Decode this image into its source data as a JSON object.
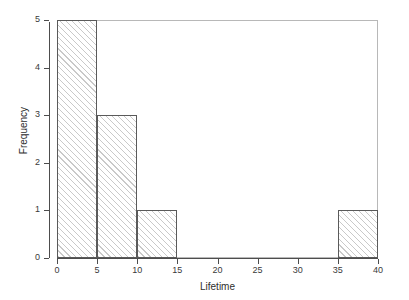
{
  "chart_data": {
    "type": "bar",
    "subtype": "histogram",
    "title": "",
    "xlabel": "Lifetime",
    "ylabel": "Frequency",
    "xlim": [
      0,
      40
    ],
    "ylim": [
      0,
      5
    ],
    "grid": false,
    "legend": null,
    "bin_width": 5,
    "bin_edges": [
      0,
      5,
      10,
      15,
      20,
      25,
      30,
      35,
      40
    ],
    "categories": [
      "0-5",
      "5-10",
      "10-15",
      "15-20",
      "20-25",
      "25-30",
      "30-35",
      "35-40"
    ],
    "values": [
      5,
      3,
      1,
      0,
      0,
      0,
      0,
      1
    ],
    "bars": [
      {
        "label": "0-5",
        "start": 0,
        "end": 5,
        "value": 5
      },
      {
        "label": "5-10",
        "start": 5,
        "end": 10,
        "value": 3
      },
      {
        "label": "10-15",
        "start": 10,
        "end": 15,
        "value": 1
      },
      {
        "label": "35-40",
        "start": 35,
        "end": 40,
        "value": 1
      }
    ],
    "xticks": [
      {
        "value": 0,
        "label": "0"
      },
      {
        "value": 5,
        "label": "5"
      },
      {
        "value": 10,
        "label": "10"
      },
      {
        "value": 15,
        "label": "15"
      },
      {
        "value": 20,
        "label": "20"
      },
      {
        "value": 25,
        "label": "25"
      },
      {
        "value": 30,
        "label": "30"
      },
      {
        "value": 35,
        "label": "35"
      },
      {
        "value": 40,
        "label": "40"
      }
    ],
    "yticks": [
      {
        "value": 0,
        "label": "0"
      },
      {
        "value": 1,
        "label": "1"
      },
      {
        "value": 2,
        "label": "2"
      },
      {
        "value": 3,
        "label": "3"
      },
      {
        "value": 4,
        "label": "4"
      },
      {
        "value": 5,
        "label": "5"
      }
    ],
    "colors": {
      "background": "#ffffff",
      "frame": "#b8b8b8",
      "axis": "#4d4d4d",
      "bar_edge": "#5a5a5a",
      "bar_hatch": "#c9c9c9",
      "text": "#2e2e2e"
    }
  }
}
